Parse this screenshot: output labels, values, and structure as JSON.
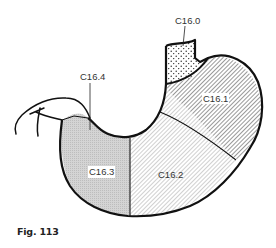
{
  "figure": {
    "caption": "Fig. 113",
    "regions": [
      {
        "code": "C16.0",
        "label": "C16.0",
        "pattern": "dots"
      },
      {
        "code": "C16.1",
        "label": "C16.1",
        "pattern": "dense-diagonal-hatch"
      },
      {
        "code": "C16.2",
        "label": "C16.2",
        "pattern": "fine-diagonal-hatch"
      },
      {
        "code": "C16.3",
        "label": "C16.3",
        "pattern": "fine-crosshatch-gray"
      },
      {
        "code": "C16.4",
        "label": "C16.4",
        "pattern": "fine-crosshatch-gray"
      }
    ],
    "colors": {
      "outline": "#111111",
      "hatch": "#555555",
      "label_text": "#333333",
      "background": "#ffffff"
    }
  }
}
